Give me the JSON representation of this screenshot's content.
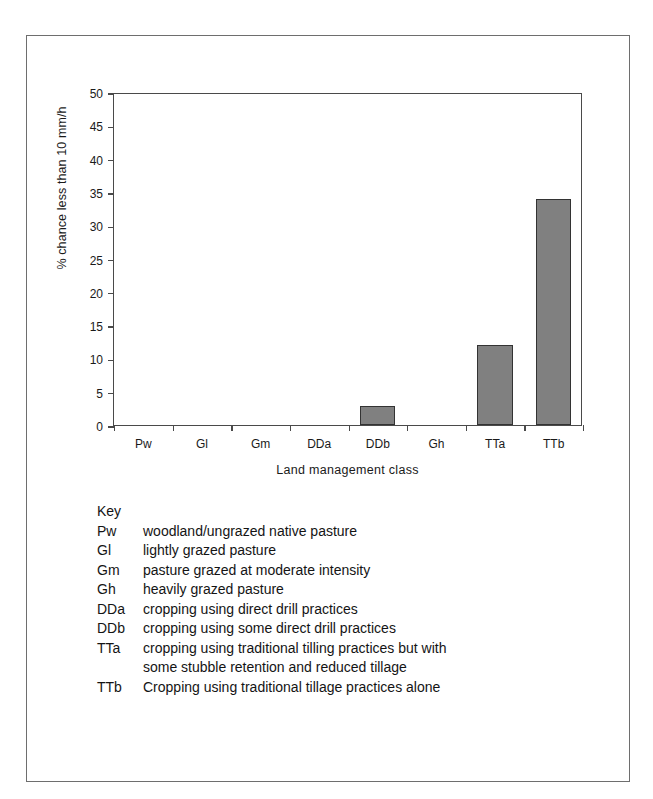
{
  "chart_data": {
    "type": "bar",
    "title": "",
    "xlabel": "Land management class",
    "ylabel": "% chance  less than 10 mm/h",
    "categories": [
      "Pw",
      "Gl",
      "Gm",
      "DDa",
      "DDb",
      "Gh",
      "TTa",
      "TTb"
    ],
    "values": [
      0,
      0,
      0,
      0,
      2.9,
      0,
      12.0,
      33.9
    ],
    "ylim": [
      0,
      50
    ],
    "ytick_step": 5,
    "yticks": [
      0,
      5,
      10,
      15,
      20,
      25,
      30,
      35,
      40,
      45,
      50
    ],
    "ytick_labels": [
      "0",
      "5",
      "10",
      "15",
      "20",
      "25",
      "30",
      "35",
      "40",
      "45",
      "50"
    ],
    "grid": false,
    "legend": "none",
    "bar_color": "#808080",
    "bar_edge_color": "#333333",
    "axis_color": "#4a4a4a"
  },
  "key": {
    "title": "Key",
    "entries": [
      {
        "code": "Pw",
        "desc": "woodland/ungrazed native pasture",
        "cont": ""
      },
      {
        "code": "Gl",
        "desc": "lightly grazed pasture",
        "cont": ""
      },
      {
        "code": "Gm",
        "desc": "pasture grazed at moderate intensity",
        "cont": ""
      },
      {
        "code": "Gh",
        "desc": "heavily grazed pasture",
        "cont": ""
      },
      {
        "code": "DDa",
        "desc": "cropping using direct drill practices",
        "cont": ""
      },
      {
        "code": "DDb",
        "desc": "cropping using some direct drill practices",
        "cont": ""
      },
      {
        "code": "TTa",
        "desc": "cropping using traditional tilling practices but with",
        "cont": "some stubble retention and reduced tillage"
      },
      {
        "code": "TTb",
        "desc": "Cropping using traditional tillage practices alone",
        "cont": ""
      }
    ]
  }
}
